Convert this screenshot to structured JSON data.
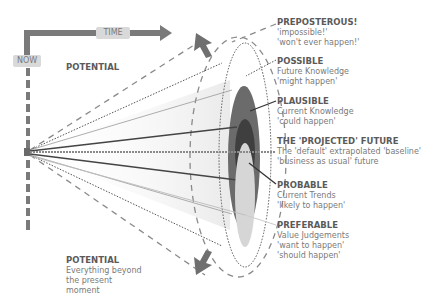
{
  "axes": {
    "time_label": "TIME",
    "now_label": "NOW"
  },
  "potential_top": {
    "title": "POTENTIAL"
  },
  "potential_bottom": {
    "title": "POTENTIAL",
    "lines": [
      "Everything beyond",
      "the present",
      "moment"
    ]
  },
  "futures": [
    {
      "id": "preposterous",
      "title": "PREPOSTEROUS!",
      "lines": [
        "'impossible!'",
        "'won't ever happen!'"
      ]
    },
    {
      "id": "possible",
      "title": "POSSIBLE",
      "lines": [
        "Future Knowledge",
        "'might happen'"
      ]
    },
    {
      "id": "plausible",
      "title": "PLAUSIBLE",
      "lines": [
        "Current Knowledge",
        "'could happen'"
      ]
    },
    {
      "id": "projected",
      "title": "THE 'PROJECTED' FUTURE",
      "lines": [
        "The 'default' extrapolated 'baseline'",
        "'business as usual' future"
      ]
    },
    {
      "id": "probable",
      "title": "PROBABLE",
      "lines": [
        "Current Trends",
        "'likely to happen'"
      ]
    },
    {
      "id": "preferable",
      "title": "PREFERABLE",
      "lines": [
        "Value Judgements",
        "'want to happen'",
        "'should happen'"
      ]
    }
  ],
  "colors": {
    "axis": "#7a7a7a",
    "plausible": "#6b6b6b",
    "probable": "#3f3f3f",
    "preferable": "#d6d6d6",
    "text": "#6e6e6e"
  }
}
